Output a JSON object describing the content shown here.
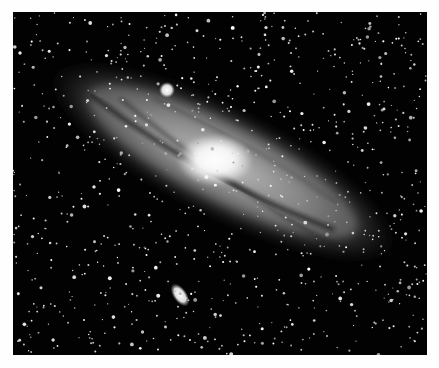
{
  "image": {
    "subject": "Spiral galaxy with companion galaxies against a star field",
    "style": "grayscale astrophotograph",
    "border_color": "#fefefe",
    "background_color": "#020202",
    "features": [
      {
        "name": "galaxy-core",
        "cx": 202,
        "cy": 148
      },
      {
        "name": "companion-galaxy-upper",
        "cx": 154,
        "cy": 78
      },
      {
        "name": "companion-galaxy-lower",
        "cx": 167,
        "cy": 283
      }
    ]
  }
}
